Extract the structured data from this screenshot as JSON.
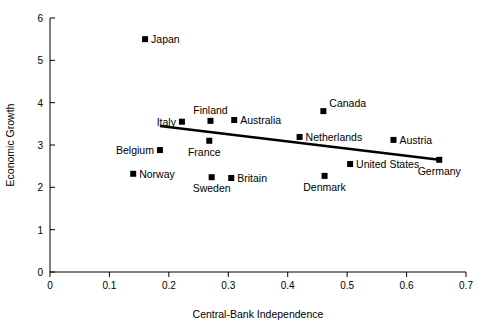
{
  "chart_data": {
    "type": "scatter",
    "title": "",
    "xlabel": "Central-Bank Independence",
    "ylabel": "Economic Growth",
    "xlim": [
      0,
      0.7
    ],
    "ylim": [
      0,
      6
    ],
    "grid": false,
    "legend": "none",
    "xticks": [
      "0",
      "0.1",
      "0.2",
      "0.3",
      "0.4",
      "0.5",
      "0.6",
      "0.7"
    ],
    "xtick_values": [
      0,
      0.1,
      0.2,
      0.3,
      0.4,
      0.5,
      0.6,
      0.7
    ],
    "yticks": [
      "0",
      "1",
      "2",
      "3",
      "4",
      "5",
      "6"
    ],
    "ytick_values": [
      0,
      1,
      2,
      3,
      4,
      5,
      6
    ],
    "points": [
      {
        "label": "Japan",
        "x": 0.16,
        "y": 5.5,
        "label_pos": "right"
      },
      {
        "label": "Canada",
        "x": 0.46,
        "y": 3.8,
        "label_pos": "right-up"
      },
      {
        "label": "Finland",
        "x": 0.27,
        "y": 3.57,
        "label_pos": "above"
      },
      {
        "label": "Italy",
        "x": 0.222,
        "y": 3.55,
        "label_pos": "left"
      },
      {
        "label": "Australia",
        "x": 0.31,
        "y": 3.59,
        "label_pos": "right"
      },
      {
        "label": "Netherlands",
        "x": 0.42,
        "y": 3.19,
        "label_pos": "right"
      },
      {
        "label": "Austria",
        "x": 0.578,
        "y": 3.12,
        "label_pos": "right"
      },
      {
        "label": "France",
        "x": 0.268,
        "y": 3.1,
        "label_pos": "below-left"
      },
      {
        "label": "Belgium",
        "x": 0.185,
        "y": 2.88,
        "label_pos": "left"
      },
      {
        "label": "United States",
        "x": 0.505,
        "y": 2.55,
        "label_pos": "right"
      },
      {
        "label": "Germany",
        "x": 0.655,
        "y": 2.65,
        "label_pos": "below"
      },
      {
        "label": "Norway",
        "x": 0.14,
        "y": 2.32,
        "label_pos": "right"
      },
      {
        "label": "Britain",
        "x": 0.305,
        "y": 2.22,
        "label_pos": "right"
      },
      {
        "label": "Denmark",
        "x": 0.462,
        "y": 2.27,
        "label_pos": "below"
      },
      {
        "label": "Sweden",
        "x": 0.272,
        "y": 2.24,
        "label_pos": "below"
      }
    ],
    "trendline": {
      "x0": 0.185,
      "y0": 3.45,
      "x1": 0.655,
      "y1": 2.65
    }
  }
}
